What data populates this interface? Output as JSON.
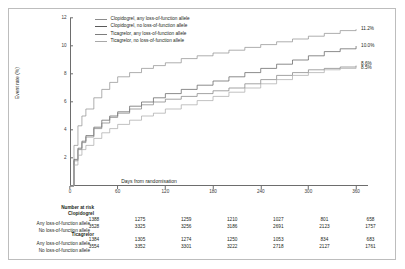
{
  "chart_data": {
    "type": "line",
    "title": "",
    "xlabel": "Days from randomisation",
    "ylabel": "Event rate (%)",
    "xlim": [
      0,
      375
    ],
    "ylim": [
      0,
      12
    ],
    "xticks": [
      "0",
      "60",
      "120",
      "180",
      "240",
      "300",
      "360"
    ],
    "xtick_values": [
      0,
      60,
      120,
      180,
      240,
      300,
      360
    ],
    "yticks": [
      "0",
      "2",
      "4",
      "6",
      "8",
      "10",
      "12"
    ],
    "ytick_values": [
      0,
      2,
      4,
      6,
      8,
      10,
      12
    ],
    "grid": false,
    "legend_position": "top-left",
    "series": [
      {
        "name": "Clopidogrel, any loss-of-function allele",
        "color": "#8c8c8c",
        "endpoint_label": "11.2%",
        "x": [
          0,
          5,
          10,
          15,
          20,
          30,
          40,
          50,
          60,
          75,
          90,
          105,
          120,
          140,
          160,
          180,
          200,
          220,
          240,
          260,
          280,
          300,
          320,
          340,
          360
        ],
        "y": [
          0,
          2.9,
          4.3,
          5.0,
          5.5,
          6.3,
          6.9,
          7.4,
          7.8,
          8.1,
          8.4,
          8.6,
          8.8,
          9.1,
          9.3,
          9.5,
          9.7,
          9.9,
          10.1,
          10.3,
          10.5,
          10.7,
          10.9,
          11.1,
          11.2
        ]
      },
      {
        "name": "Clopidogrel, no loss-of-function allele",
        "color": "#5a5a5a",
        "endpoint_label": "10.0%",
        "x": [
          0,
          5,
          10,
          15,
          20,
          30,
          40,
          50,
          60,
          75,
          90,
          105,
          120,
          140,
          160,
          180,
          200,
          220,
          240,
          260,
          280,
          300,
          320,
          340,
          360
        ],
        "y": [
          0,
          1.9,
          2.7,
          3.2,
          3.6,
          4.2,
          4.7,
          5.0,
          5.3,
          5.7,
          6.0,
          6.3,
          6.6,
          6.9,
          7.2,
          7.5,
          7.8,
          8.1,
          8.4,
          8.7,
          9.0,
          9.3,
          9.6,
          9.8,
          10.0
        ]
      },
      {
        "name": "Ticagrelor, any loss-of-function allele",
        "color": "#7d7d7d",
        "endpoint_label": "8.6%",
        "x": [
          0,
          5,
          10,
          15,
          20,
          30,
          40,
          50,
          60,
          75,
          90,
          105,
          120,
          140,
          160,
          180,
          200,
          220,
          240,
          260,
          280,
          300,
          320,
          340,
          360
        ],
        "y": [
          0,
          1.8,
          2.6,
          3.1,
          3.5,
          4.1,
          4.5,
          4.9,
          5.2,
          5.5,
          5.8,
          6.0,
          6.2,
          6.4,
          6.6,
          6.8,
          7.0,
          7.3,
          7.6,
          7.9,
          8.1,
          8.3,
          8.4,
          8.5,
          8.6
        ]
      },
      {
        "name": "Ticagrelor, no loss-of-function allele",
        "color": "#a8a8a8",
        "endpoint_label": "8.5%",
        "x": [
          0,
          5,
          10,
          15,
          20,
          30,
          40,
          50,
          60,
          75,
          90,
          105,
          120,
          140,
          160,
          180,
          200,
          220,
          240,
          260,
          280,
          300,
          320,
          340,
          360
        ],
        "y": [
          0,
          1.5,
          2.2,
          2.6,
          2.9,
          3.4,
          3.8,
          4.1,
          4.4,
          4.7,
          5.0,
          5.2,
          5.5,
          5.8,
          6.1,
          6.4,
          6.7,
          7.0,
          7.3,
          7.6,
          7.9,
          8.1,
          8.3,
          8.4,
          8.5
        ]
      }
    ]
  },
  "legend": {
    "items": [
      {
        "label": "Clopidogrel, any loss-of-function allele"
      },
      {
        "label": "Clopidogrel, no loss-of-function allele"
      },
      {
        "label": "Ticagrelor, any loss-of-function allele"
      },
      {
        "label": "Ticagrelor, no loss-of-function allele"
      }
    ]
  },
  "risk_table": {
    "title": "Number at risk",
    "columns": [
      "0",
      "60",
      "120",
      "180",
      "240",
      "300",
      "360"
    ],
    "groups": [
      {
        "name": "Clopidogrel",
        "rows": [
          {
            "label": "Any loss-of-function allele",
            "values": [
              "1388",
              "1275",
              "1259",
              "1210",
              "1027",
              "801",
              "658"
            ]
          },
          {
            "label": "No loss-of-function allele",
            "values": [
              "3528",
              "3325",
              "3256",
              "3186",
              "2691",
              "2123",
              "1757"
            ]
          }
        ]
      },
      {
        "name": "Ticagrelor",
        "rows": [
          {
            "label": "Any loss-of-function allele",
            "values": [
              "1384",
              "1305",
              "1274",
              "1250",
              "1053",
              "834",
              "683"
            ]
          },
          {
            "label": "No loss-of-function allele",
            "values": [
              "3554",
              "3352",
              "3301",
              "3222",
              "2718",
              "2127",
              "1761"
            ]
          }
        ]
      }
    ]
  }
}
